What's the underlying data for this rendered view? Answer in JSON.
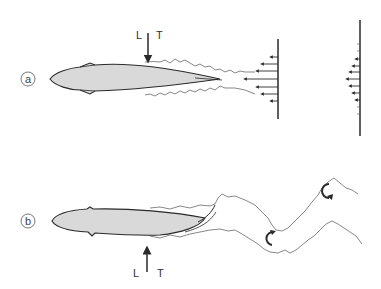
{
  "diagram": {
    "title": "",
    "colors": {
      "stroke": "#2a2a2a",
      "body_fill": "#d9d9d9",
      "wake_line": "#555555",
      "background": "#ffffff"
    },
    "panels": [
      {
        "id": "a",
        "label": "a",
        "force_arrow": {
          "direction": "down",
          "left_label": "L",
          "right_label": "T"
        },
        "description": "Streamlined body with straight wake; momentum profile arrows pointing left",
        "profiles": [
          {
            "name": "wake-velocity-profile",
            "arrow_count": 7
          },
          {
            "name": "far-wake-velocity-profile",
            "arrow_count": 7
          }
        ]
      },
      {
        "id": "b",
        "label": "b",
        "force_arrow": {
          "direction": "up",
          "left_label": "L",
          "right_label": "T"
        },
        "description": "Flexing body with undulating wake and two vortices",
        "vortices": [
          {
            "name": "vortex-lower",
            "rotation": "clockwise"
          },
          {
            "name": "vortex-upper",
            "rotation": "clockwise"
          }
        ]
      }
    ]
  }
}
